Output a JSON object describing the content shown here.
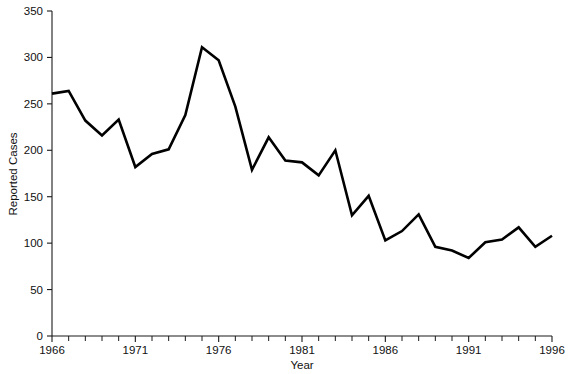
{
  "chart_data": {
    "type": "line",
    "title": "",
    "xlabel": "Year",
    "ylabel": "Reported Cases",
    "xlim": [
      1966,
      1996
    ],
    "ylim": [
      0,
      350
    ],
    "grid": false,
    "legend": null,
    "y_ticks": [
      0,
      50,
      100,
      150,
      200,
      250,
      300,
      350
    ],
    "y_tick_labels": [
      "0",
      "50",
      "100",
      "150",
      "200",
      "250",
      "300",
      "350"
    ],
    "x_ticks": [
      1966,
      1967,
      1968,
      1969,
      1970,
      1971,
      1972,
      1973,
      1974,
      1975,
      1976,
      1977,
      1978,
      1979,
      1980,
      1981,
      1982,
      1983,
      1984,
      1985,
      1986,
      1987,
      1988,
      1989,
      1990,
      1991,
      1992,
      1993,
      1994,
      1995,
      1996
    ],
    "x_tick_labels_shown": [
      "1966",
      "1971",
      "1976",
      "1981",
      "1986",
      "1991",
      "1996"
    ],
    "x_labeled_ticks": [
      1966,
      1971,
      1976,
      1981,
      1986,
      1991,
      1996
    ],
    "line_color": "#000000",
    "line_width": 2.6,
    "x": [
      1966,
      1967,
      1968,
      1969,
      1970,
      1971,
      1972,
      1973,
      1974,
      1975,
      1976,
      1977,
      1978,
      1979,
      1980,
      1981,
      1982,
      1983,
      1984,
      1985,
      1986,
      1987,
      1988,
      1989,
      1990,
      1991,
      1992,
      1993,
      1994,
      1995,
      1996
    ],
    "values": [
      261,
      264,
      232,
      216,
      233,
      182,
      196,
      201,
      238,
      311,
      297,
      247,
      179,
      214,
      189,
      187,
      173,
      200,
      130,
      151,
      103,
      113,
      131,
      96,
      92,
      84,
      101,
      104,
      117,
      96,
      108
    ],
    "series": [
      {
        "name": "Reported Cases",
        "values": [
          261,
          264,
          232,
          216,
          233,
          182,
          196,
          201,
          238,
          311,
          297,
          247,
          179,
          214,
          189,
          187,
          173,
          200,
          130,
          151,
          103,
          113,
          131,
          96,
          92,
          84,
          101,
          104,
          117,
          96,
          108
        ]
      }
    ]
  },
  "axes": {
    "y_title": "Reported Cases",
    "x_title": "Year"
  }
}
